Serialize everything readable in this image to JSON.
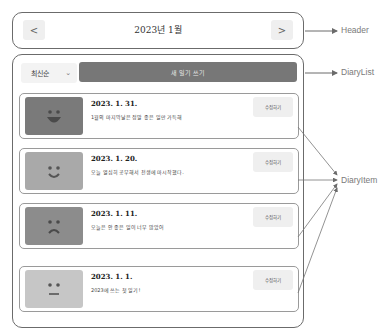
{
  "header": {
    "title": "2023년 1월",
    "prev_label": "<",
    "next_label": ">"
  },
  "diary_list": {
    "sort_select": {
      "selected": "최신순",
      "chevron": "⌄"
    },
    "new_button_label": "새 일기 쓰기",
    "items": [
      {
        "date": "2023. 1. 31.",
        "content": "1월의 마지막날은 정말 좋은 일만 가득해",
        "emotion": "very-happy",
        "emotion_color": "#7a7a7a",
        "edit_label": "수정하기"
      },
      {
        "date": "2023. 1. 20.",
        "content": "오늘 열심히 공부해서 전생에 마시작했다.",
        "emotion": "happy",
        "emotion_color": "#a9a9a9",
        "edit_label": "수정하기"
      },
      {
        "date": "2023. 1. 11.",
        "content": "오늘은 안 좋은 일이 너무 많았어",
        "emotion": "sad",
        "emotion_color": "#8c8c8c",
        "edit_label": "수정하기"
      },
      {
        "date": "2023. 1. 1.",
        "content": "2023에 쓰는 첫 일기!",
        "emotion": "neutral",
        "emotion_color": "#c6c6c6",
        "edit_label": "수정하기"
      }
    ]
  },
  "annotations": {
    "header": "Header",
    "diary_list": "DiaryList",
    "diary_item": "DiaryItem"
  }
}
